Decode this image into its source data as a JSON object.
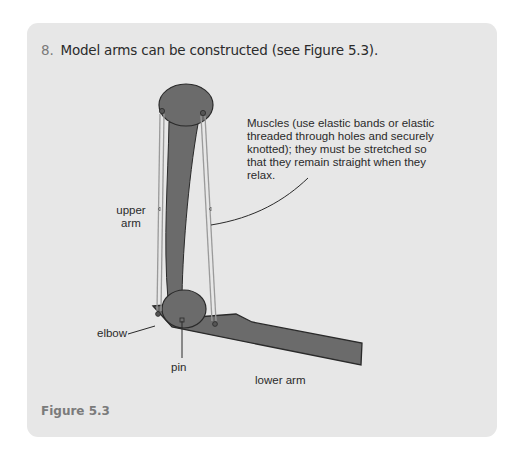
{
  "step": {
    "number": "8.",
    "text": "Model arms can be constructed (see Figure 5.3)."
  },
  "figure": {
    "labels": {
      "muscles": "Muscles (use elastic bands or elastic threaded through holes and securely knotted); they must be stretched so that they remain straight when they relax.",
      "upper_arm_line1": "upper",
      "upper_arm_line2": "arm",
      "elbow": "elbow",
      "pin": "pin",
      "lower_arm": "lower arm"
    },
    "caption": "Figure 5.3",
    "colors": {
      "panel": "#e7e7e7",
      "arm_fill": "#6b6b6b",
      "arm_stroke": "#2a2a2a",
      "elastic": "#9a9a9a"
    }
  }
}
